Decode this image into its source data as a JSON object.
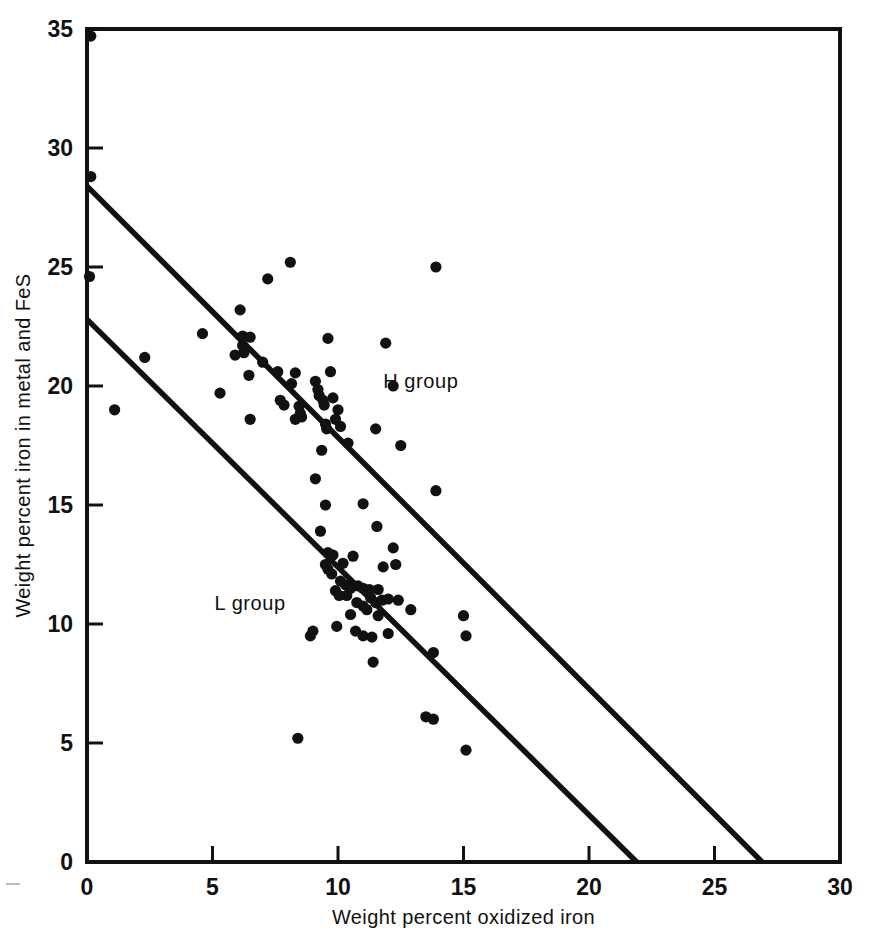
{
  "figure": {
    "background_color": "#ffffff",
    "ink_color": "#111111"
  },
  "chart_data": {
    "type": "scatter",
    "title": "",
    "subtitle": "",
    "xlabel": "Weight percent oxidized iron",
    "ylabel": "Weight percent iron in metal and FeS",
    "xlim": [
      0,
      30
    ],
    "ylim": [
      0,
      35
    ],
    "xticks": [
      0,
      5,
      10,
      15,
      20,
      25,
      30
    ],
    "yticks": [
      0,
      5,
      10,
      15,
      20,
      25,
      30,
      35
    ],
    "xtick_labels": [
      "0",
      "5",
      "10",
      "15",
      "20",
      "25",
      "30"
    ],
    "ytick_labels": [
      "0",
      "5",
      "10",
      "15",
      "20",
      "25",
      "30",
      "35"
    ],
    "grid": false,
    "legend": "none",
    "tick_direction": "in",
    "annotations": [
      {
        "text": "H group",
        "x": 13.3,
        "y": 19.9
      },
      {
        "text": "L group",
        "x": 6.5,
        "y": 10.6
      }
    ],
    "reference_lines": [
      {
        "name": "H group isochemical line",
        "x": [
          0,
          26.9
        ],
        "y": [
          28.4,
          0
        ],
        "slope": -1.0558,
        "intercept": 28.4
      },
      {
        "name": "L group isochemical line",
        "x": [
          0,
          21.9
        ],
        "y": [
          22.8,
          0
        ],
        "slope": -1.0411,
        "intercept": 22.8
      }
    ],
    "series": [
      {
        "name": "Chondrite analyses",
        "marker": "filled-circle",
        "color": "#111111",
        "points": [
          [
            0.15,
            34.7
          ],
          [
            0.15,
            28.8
          ],
          [
            0.1,
            24.6
          ],
          [
            1.1,
            19.0
          ],
          [
            2.3,
            21.2
          ],
          [
            4.6,
            22.2
          ],
          [
            5.3,
            19.7
          ],
          [
            6.1,
            23.2
          ],
          [
            6.2,
            22.1
          ],
          [
            6.2,
            21.7
          ],
          [
            6.25,
            21.4
          ],
          [
            6.5,
            22.05
          ],
          [
            5.9,
            21.3
          ],
          [
            6.45,
            20.45
          ],
          [
            6.5,
            18.6
          ],
          [
            7.0,
            21.0
          ],
          [
            7.2,
            24.5
          ],
          [
            8.1,
            25.2
          ],
          [
            8.15,
            20.1
          ],
          [
            7.6,
            20.6
          ],
          [
            7.7,
            19.4
          ],
          [
            7.85,
            19.2
          ],
          [
            8.3,
            20.55
          ],
          [
            8.45,
            19.15
          ],
          [
            8.5,
            18.85
          ],
          [
            8.3,
            18.6
          ],
          [
            8.55,
            18.7
          ],
          [
            9.1,
            20.2
          ],
          [
            9.2,
            19.85
          ],
          [
            9.25,
            19.6
          ],
          [
            9.4,
            19.4
          ],
          [
            9.45,
            19.2
          ],
          [
            9.5,
            18.4
          ],
          [
            9.55,
            18.2
          ],
          [
            9.6,
            22.0
          ],
          [
            9.7,
            20.6
          ],
          [
            9.8,
            19.5
          ],
          [
            10.0,
            19.0
          ],
          [
            9.9,
            18.6
          ],
          [
            10.1,
            18.3
          ],
          [
            9.35,
            17.3
          ],
          [
            10.4,
            17.6
          ],
          [
            11.5,
            18.2
          ],
          [
            11.9,
            21.8
          ],
          [
            13.9,
            25.0
          ],
          [
            12.2,
            20.0
          ],
          [
            12.5,
            17.5
          ],
          [
            9.1,
            16.1
          ],
          [
            9.5,
            15.0
          ],
          [
            13.9,
            15.6
          ],
          [
            11.0,
            15.05
          ],
          [
            11.55,
            14.1
          ],
          [
            9.3,
            13.9
          ],
          [
            9.6,
            13.0
          ],
          [
            9.8,
            12.9
          ],
          [
            12.2,
            13.2
          ],
          [
            11.8,
            12.4
          ],
          [
            12.3,
            12.5
          ],
          [
            9.5,
            12.5
          ],
          [
            9.6,
            12.3
          ],
          [
            9.75,
            12.1
          ],
          [
            10.2,
            12.55
          ],
          [
            10.6,
            12.85
          ],
          [
            10.1,
            11.8
          ],
          [
            10.3,
            11.65
          ],
          [
            10.5,
            11.5
          ],
          [
            9.9,
            11.4
          ],
          [
            10.05,
            11.2
          ],
          [
            10.35,
            11.2
          ],
          [
            10.8,
            11.6
          ],
          [
            11.0,
            11.5
          ],
          [
            11.25,
            11.45
          ],
          [
            11.6,
            11.45
          ],
          [
            11.3,
            11.1
          ],
          [
            11.5,
            10.9
          ],
          [
            11.75,
            11.0
          ],
          [
            12.0,
            11.05
          ],
          [
            12.4,
            11.0
          ],
          [
            10.75,
            10.9
          ],
          [
            11.0,
            10.75
          ],
          [
            11.15,
            10.6
          ],
          [
            10.5,
            10.4
          ],
          [
            11.6,
            10.35
          ],
          [
            12.9,
            10.6
          ],
          [
            15.0,
            10.35
          ],
          [
            9.95,
            9.9
          ],
          [
            9.0,
            9.7
          ],
          [
            10.7,
            9.7
          ],
          [
            11.0,
            9.5
          ],
          [
            11.35,
            9.45
          ],
          [
            12.0,
            9.6
          ],
          [
            13.8,
            8.8
          ],
          [
            15.1,
            9.5
          ],
          [
            11.4,
            8.4
          ],
          [
            8.9,
            9.5
          ],
          [
            8.4,
            5.2
          ],
          [
            13.5,
            6.1
          ],
          [
            13.8,
            6.0
          ],
          [
            15.1,
            4.7
          ]
        ]
      }
    ]
  }
}
